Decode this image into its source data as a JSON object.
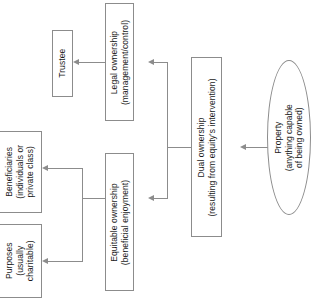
{
  "diagram": {
    "orientation": "right-to-left, text rotated 90 degrees",
    "colors": {
      "background": "#ffffff",
      "stroke": "#8c8c8c",
      "text": "#1a1a1a"
    },
    "nodes": [
      {
        "id": "property",
        "shape": "ellipse",
        "line1": "Property",
        "line2": "(anything capable",
        "line3": "of being owned)"
      },
      {
        "id": "dual-ownership",
        "shape": "rect",
        "line1": "Dual ownership",
        "line2": "(resulting from equity's intervention)"
      },
      {
        "id": "legal-ownership",
        "shape": "rect",
        "line1": "Legal ownership",
        "line2": "(management/control)"
      },
      {
        "id": "equitable-ownership",
        "shape": "rect",
        "line1": "Equitable ownership",
        "line2": "(beneficial enjoyment)"
      },
      {
        "id": "trustee",
        "shape": "rect",
        "line1": "Trustee"
      },
      {
        "id": "beneficiaries",
        "shape": "rect",
        "line1": "Beneficiaries",
        "line2": "(individuals or",
        "line3": "private class)"
      },
      {
        "id": "purposes",
        "shape": "rect",
        "line1": "Purposes",
        "line2": "(usually",
        "line3": "charitable)"
      }
    ],
    "edges": [
      {
        "from": "property",
        "to": "dual-ownership"
      },
      {
        "from": "dual-ownership",
        "to": "legal-ownership"
      },
      {
        "from": "dual-ownership",
        "to": "equitable-ownership"
      },
      {
        "from": "legal-ownership",
        "to": "trustee"
      },
      {
        "from": "equitable-ownership",
        "to": "beneficiaries"
      },
      {
        "from": "equitable-ownership",
        "to": "purposes"
      }
    ]
  }
}
